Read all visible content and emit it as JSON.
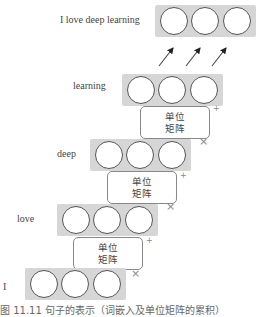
{
  "diagram": {
    "rows": [
      {
        "label": "I love deep learning",
        "nodes": 3,
        "role": "output"
      },
      {
        "label": "learning",
        "nodes": 3,
        "role": "step"
      },
      {
        "label": "deep",
        "nodes": 3,
        "role": "step"
      },
      {
        "label": "love",
        "nodes": 3,
        "role": "step"
      },
      {
        "label": "I",
        "nodes": 3,
        "role": "step"
      }
    ],
    "matrix_blocks": [
      {
        "line1": "单位",
        "line2": "矩阵"
      },
      {
        "line1": "单位",
        "line2": "矩阵"
      },
      {
        "line1": "单位",
        "line2": "矩阵"
      }
    ],
    "operators": {
      "plus": "+",
      "times": "×"
    },
    "arrow_count": 3,
    "caption": "图 11.11 句子的表示（词嵌入及单位矩阵的累积）"
  },
  "colors": {
    "vector_fill": "#d6d6d6",
    "node_stroke": "#555555",
    "matrix_border": "#888888"
  }
}
